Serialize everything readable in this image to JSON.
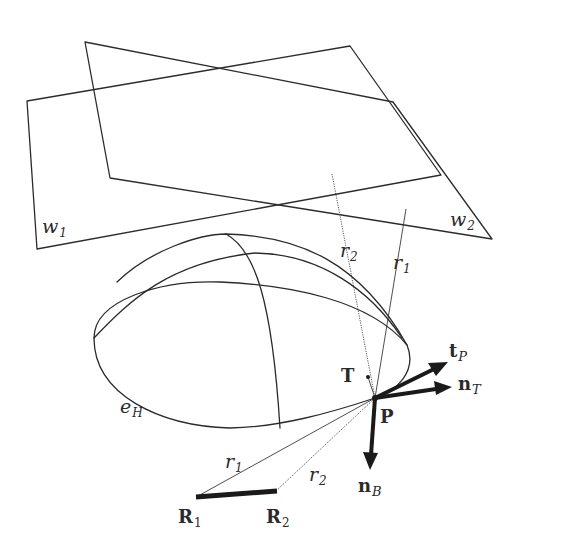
{
  "figure": {
    "planes": [
      {
        "id": "w1",
        "label": "w",
        "subscript": "1",
        "corners": [
          [
            27,
            101
          ],
          [
            350,
            46
          ],
          [
            441,
            175
          ],
          [
            37,
            249
          ]
        ]
      },
      {
        "id": "w2",
        "label": "w",
        "subscript": "2",
        "corners": [
          [
            85,
            42
          ],
          [
            393,
            102
          ],
          [
            492,
            239
          ],
          [
            110,
            178
          ]
        ]
      }
    ],
    "ellipse": {
      "label": "e",
      "subscript": "H"
    },
    "rays": [
      {
        "id": "r1-upper",
        "label": "r",
        "subscript": "1",
        "style": "solid"
      },
      {
        "id": "r2-upper",
        "label": "r",
        "subscript": "2",
        "style": "dotted"
      },
      {
        "id": "r1-lower",
        "label": "r",
        "subscript": "1",
        "style": "solid"
      },
      {
        "id": "r2-lower",
        "label": "r",
        "subscript": "2",
        "style": "dotted"
      }
    ],
    "points": [
      {
        "id": "P",
        "label": "P"
      },
      {
        "id": "T",
        "label": "T"
      },
      {
        "id": "R1",
        "label": "R",
        "subscript": "1"
      },
      {
        "id": "R2",
        "label": "R",
        "subscript": "2"
      }
    ],
    "vectors": [
      {
        "id": "tP",
        "label": "t",
        "subscript": "P"
      },
      {
        "id": "nT",
        "label": "n",
        "subscript": "T"
      },
      {
        "id": "nB",
        "label": "n",
        "subscript": "B"
      }
    ]
  },
  "labels": {
    "w1": {
      "main": "w",
      "sub": "1"
    },
    "w2": {
      "main": "w",
      "sub": "2"
    },
    "eH": {
      "main": "e",
      "sub": "H"
    },
    "r1_upper": {
      "main": "r",
      "sub": "1"
    },
    "r2_upper": {
      "main": "r",
      "sub": "2"
    },
    "r1_lower": {
      "main": "r",
      "sub": "1"
    },
    "r2_lower": {
      "main": "r",
      "sub": "2"
    },
    "P": "P",
    "T": "T",
    "R1": {
      "main": "R",
      "sub": "1"
    },
    "R2": {
      "main": "R",
      "sub": "2"
    },
    "tP": {
      "main": "t",
      "sub": "P"
    },
    "nT": {
      "main": "n",
      "sub": "T"
    },
    "nB": {
      "main": "n",
      "sub": "B"
    }
  }
}
